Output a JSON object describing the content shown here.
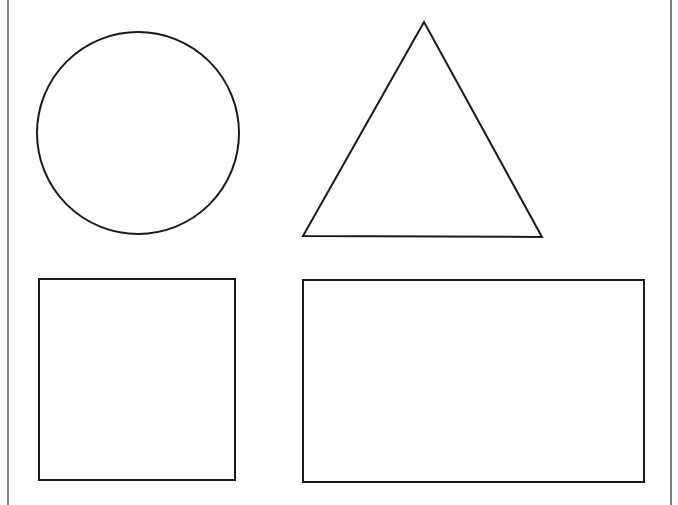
{
  "canvas": {
    "width": 678,
    "height": 505,
    "background": "#ffffff",
    "stroke_color": "#1a1a1a"
  },
  "borders": {
    "left": {
      "x": 8
    },
    "right": {
      "x": 671
    }
  },
  "shapes": [
    {
      "type": "circle",
      "cx": 138,
      "cy": 133,
      "r": 101
    },
    {
      "type": "triangle",
      "points": [
        [
          424,
          22
        ],
        [
          303,
          236
        ],
        [
          542,
          237
        ]
      ]
    },
    {
      "type": "square",
      "x": 39,
      "y": 279,
      "width": 196,
      "height": 201
    },
    {
      "type": "rectangle",
      "x": 303,
      "y": 280,
      "width": 341,
      "height": 202
    }
  ]
}
